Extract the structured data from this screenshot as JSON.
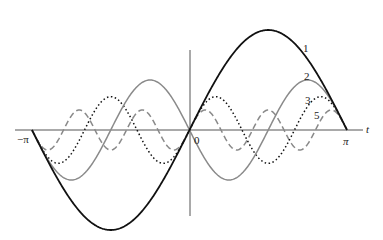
{
  "chart_data": {
    "type": "line",
    "title": "",
    "xlabel": "t",
    "ylabel": "",
    "xlim": [
      -3.14159,
      3.14159
    ],
    "ylim": [
      -2,
      2
    ],
    "x_tick_labels": [
      "−π",
      "0",
      "π"
    ],
    "grid": false,
    "series": [
      {
        "name": "1",
        "n": 1,
        "coef": 2,
        "formula": "2 sin t",
        "style": "solid",
        "color": "#111111"
      },
      {
        "name": "2",
        "n": 2,
        "coef": -1,
        "formula": "-sin 2t",
        "style": "solid",
        "color": "#8a8a8a"
      },
      {
        "name": "3",
        "n": 3,
        "coef": 0.6667,
        "formula": "(2/3) sin 3t",
        "style": "dotted",
        "color": "#111111"
      },
      {
        "name": "5",
        "n": 5,
        "coef": 0.4,
        "formula": "(2/5) sin 5t",
        "style": "dashed",
        "color": "#8a8a8a"
      }
    ]
  },
  "labels": {
    "axis_t": "t",
    "neg_pi": "−π",
    "zero": "0",
    "pi": "π",
    "curve1": "1",
    "curve2": "2",
    "curve3": "3",
    "curve5": "5"
  }
}
